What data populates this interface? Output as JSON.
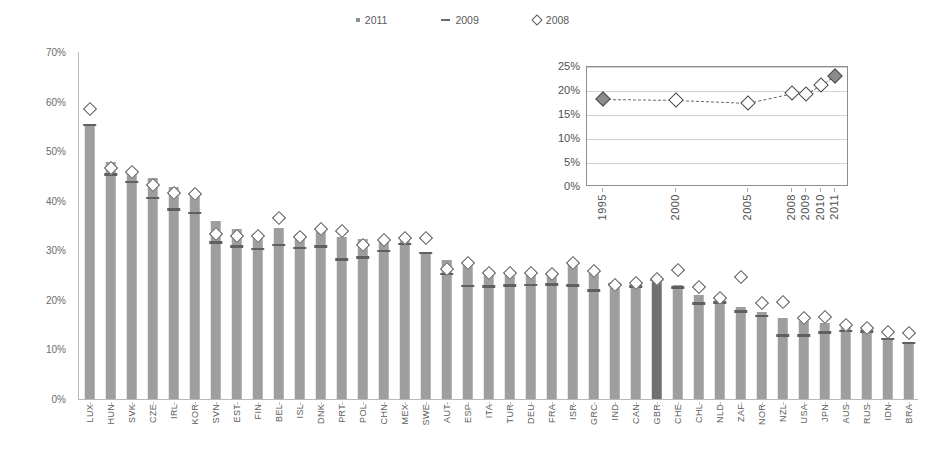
{
  "legend": {
    "items": [
      {
        "label": "2011",
        "marker": "square-marker"
      },
      {
        "label": "2009",
        "marker": "dash-marker"
      },
      {
        "label": "2008",
        "marker": "diamond-marker"
      }
    ]
  },
  "chart_data": {
    "type": "bar",
    "title": "",
    "xlabel": "",
    "ylabel": "",
    "ylim": [
      0,
      70
    ],
    "yticks": [
      "0%",
      "10%",
      "20%",
      "30%",
      "40%",
      "50%",
      "60%",
      "70%"
    ],
    "grid": false,
    "legend_position": "top-center",
    "highlight_category": "GBR",
    "categories": [
      "LUX",
      "HUN",
      "SVK",
      "CZE",
      "IRL",
      "KOR",
      "SVN",
      "EST",
      "FIN",
      "BEL",
      "ISL",
      "DNK",
      "PRT",
      "POL",
      "CHN",
      "MEX",
      "SWE",
      "AUT",
      "ESP",
      "ITA",
      "TUR",
      "DEU",
      "FRA",
      "ISR",
      "GRC",
      "IND",
      "CAN",
      "GBR",
      "CHE",
      "CHL",
      "NLD",
      "ZAF",
      "NOR",
      "NZL",
      "USA",
      "JPN",
      "AUS",
      "RUS",
      "IDN",
      "BRA"
    ],
    "series": [
      {
        "name": "2011",
        "type": "bar",
        "values": [
          55.0,
          47.8,
          45.8,
          44.5,
          42.7,
          41.8,
          36.0,
          34.3,
          33.4,
          34.5,
          33.2,
          34.0,
          32.7,
          32.2,
          31.6,
          31.9,
          29.3,
          28.0,
          27.6,
          26.0,
          25.9,
          25.7,
          25.4,
          27.3,
          26.2,
          23.6,
          23.4,
          24.2,
          23.1,
          20.9,
          20.5,
          18.6,
          17.6,
          16.4,
          15.9,
          15.3,
          14.6,
          14.3,
          12.3,
          11.2
        ]
      },
      {
        "name": "2009",
        "type": "marker-dash",
        "values": [
          55.0,
          45.0,
          43.5,
          40.3,
          38.0,
          37.3,
          31.3,
          30.5,
          30.0,
          30.8,
          30.2,
          30.5,
          27.9,
          28.3,
          29.6,
          31.0,
          29.2,
          25.0,
          22.5,
          22.4,
          22.6,
          22.7,
          22.8,
          22.6,
          21.6,
          22.8,
          22.4,
          23.8,
          22.2,
          19.0,
          19.2,
          17.4,
          16.5,
          12.6,
          12.6,
          13.2,
          13.5,
          13.4,
          11.9,
          11.0
        ]
      },
      {
        "name": "2008",
        "type": "marker-diamond",
        "values": [
          58.5,
          46.6,
          45.8,
          43.2,
          41.5,
          41.3,
          33.3,
          32.9,
          32.8,
          36.6,
          32.6,
          34.3,
          33.9,
          31.0,
          32.1,
          32.5,
          32.5,
          26.2,
          27.5,
          25.4,
          25.4,
          25.4,
          25.3,
          27.4,
          25.9,
          23.1,
          23.4,
          24.2,
          26.0,
          22.5,
          20.3,
          24.6,
          19.4,
          19.5,
          16.4,
          16.6,
          15.0,
          14.3,
          13.5,
          13.4
        ]
      }
    ]
  },
  "inset_chart": {
    "type": "line",
    "title": "",
    "ylim": [
      0,
      25
    ],
    "yticks": [
      "0%",
      "5%",
      "10%",
      "15%",
      "20%",
      "25%"
    ],
    "xticks": [
      "1995",
      "2000",
      "2005",
      "2008",
      "2009",
      "2010",
      "2011"
    ],
    "grid": true,
    "line_style": "dashed",
    "marker": "diamond",
    "series": [
      {
        "name": "world",
        "x": [
          1995,
          2000,
          2005,
          2008,
          2009,
          2010,
          2011
        ],
        "values": [
          18.4,
          18.2,
          17.6,
          19.6,
          19.4,
          21.2,
          23.2
        ],
        "filled_points": [
          1995,
          2011
        ]
      }
    ]
  }
}
